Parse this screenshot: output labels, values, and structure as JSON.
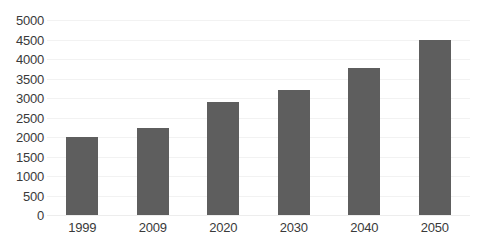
{
  "chart_data": {
    "type": "bar",
    "title": "",
    "subtitle": "",
    "xlabel": "",
    "ylabel": "",
    "categories": [
      "1999",
      "2009",
      "2020",
      "2030",
      "2040",
      "2050"
    ],
    "values": [
      2000,
      2230,
      2900,
      3200,
      3780,
      4500
    ],
    "series": [
      {
        "name": "",
        "values": [
          2000,
          2230,
          2900,
          3200,
          3780,
          4500
        ]
      }
    ],
    "ylim": [
      0,
      5000
    ],
    "ytick_step": 500,
    "ytick_labels": [
      "5000",
      "4500",
      "4000",
      "3500",
      "3000",
      "2500",
      "2000",
      "1500",
      "1000",
      "500",
      "0"
    ],
    "ytick_values": [
      5000,
      4500,
      4000,
      3500,
      3000,
      2500,
      2000,
      1500,
      1000,
      500,
      0
    ],
    "grid": true,
    "grid_axis": "y",
    "legend": false,
    "legend_position": "none",
    "annotations": [],
    "colors": {
      "bar_fill": "#5e5e5e",
      "gridline": "#f2f2f2",
      "baseline": "#ededed",
      "tick_text": "#3a3a3a",
      "background": "#ffffff"
    }
  }
}
